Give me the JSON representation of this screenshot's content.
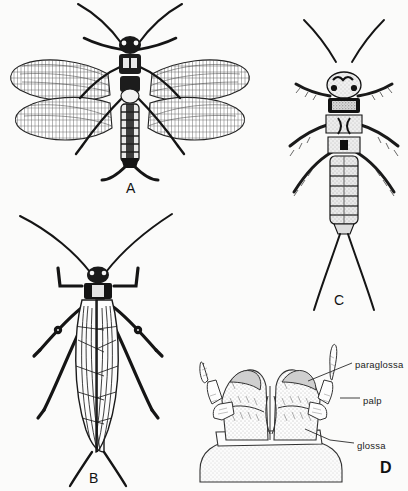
{
  "plate": {
    "title": "Plecoptera plate: adults, nymph and labium",
    "background_color": "#fbfbfa",
    "ink_color": "#111111",
    "width": 408,
    "height": 491
  },
  "panels": [
    {
      "id": "A",
      "letter": "A",
      "name": "panel-a-winged-adult-dorsal",
      "description": "Winged adult stonefly, dorsal view, wings outspread",
      "letter_x": 126,
      "letter_y": 181,
      "letter_style": "regular"
    },
    {
      "id": "B",
      "letter": "B",
      "name": "panel-b-adult-wings-folded",
      "description": "Adult stonefly, dorsal view, wings folded over abdomen",
      "letter_x": 89,
      "letter_y": 471,
      "letter_style": "regular"
    },
    {
      "id": "C",
      "letter": "C",
      "name": "panel-c-nymph-dorsal",
      "description": "Stonefly nymph, dorsal view with long cerci",
      "letter_x": 334,
      "letter_y": 293,
      "letter_style": "regular"
    },
    {
      "id": "D",
      "letter": "D",
      "name": "panel-d-labium-detail",
      "description": "Labium detail showing paraglossa, palp and glossa",
      "letter_x": 380,
      "letter_y": 460,
      "letter_style": "bold"
    }
  ],
  "callouts": [
    {
      "id": "paraglossa",
      "label": "paraglossa",
      "x": 355,
      "y": 360,
      "name": "callout-paraglossa"
    },
    {
      "id": "palp",
      "label": "palp",
      "x": 363,
      "y": 396,
      "name": "callout-palp"
    },
    {
      "id": "glossa",
      "label": "glossa",
      "x": 357,
      "y": 441,
      "name": "callout-glossa"
    }
  ],
  "leader_lines": [
    {
      "for": "paraglossa",
      "points": "352,363 330,372 308,381"
    },
    {
      "for": "palp",
      "points": "360,398 340,398"
    },
    {
      "for": "glossa",
      "points": "354,443 330,440 305,429"
    }
  ]
}
